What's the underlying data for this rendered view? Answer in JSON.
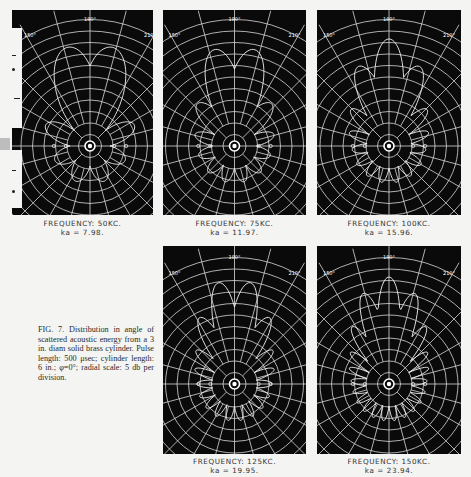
{
  "figure": {
    "label": "FIG. 7.",
    "caption": "FIG. 7. Distribution in angle of scattered acoustic energy from a 3 in. diam solid brass cylinder. Pulse length: 500 μsec; cylinder length: 6 in.; φ=0°; radial scale: 5 db per division."
  },
  "panels": [
    {
      "id": "p50",
      "frequency": "FREQUENCY: 50KC.",
      "ka": "ka = 7.98.",
      "angle_labels": {
        "top": "180°",
        "left": "150°",
        "right": "210°"
      }
    },
    {
      "id": "p75",
      "frequency": "FREQUENCY: 75KC.",
      "ka": "ka = 11.97.",
      "angle_labels": {
        "top": "180°",
        "left": "150°",
        "right": "210°"
      }
    },
    {
      "id": "p100",
      "frequency": "FREQUENCY: 100KC.",
      "ka": "ka = 15.96.",
      "angle_labels": {
        "top": "180°",
        "left": "150°",
        "right": "210°"
      }
    },
    {
      "id": "p125",
      "frequency": "FREQUENCY: 125KC.",
      "ka": "ka = 19.95.",
      "angle_labels": {
        "top": "180°",
        "left": "150°",
        "right": "210°"
      }
    },
    {
      "id": "p150",
      "frequency": "FREQUENCY: 150KC.",
      "ka": "ka = 23.94.",
      "angle_labels": {
        "top": "180°",
        "left": "150°",
        "right": "210°"
      }
    }
  ],
  "chart_data": [
    {
      "type": "polar",
      "title": "FREQUENCY: 50KC.",
      "subtitle": "ka = 7.98",
      "radial_scale": "5 db per division",
      "grid": true,
      "angular_step_deg": 15,
      "lobes_deg": [
        0,
        20,
        40,
        70,
        110,
        140,
        160,
        180,
        200,
        220,
        250,
        290,
        320,
        340
      ]
    },
    {
      "type": "polar",
      "title": "FREQUENCY: 75KC.",
      "subtitle": "ka = 11.97",
      "radial_scale": "5 db per division",
      "grid": true,
      "angular_step_deg": 15
    },
    {
      "type": "polar",
      "title": "FREQUENCY: 100KC.",
      "subtitle": "ka = 15.96",
      "radial_scale": "5 db per division",
      "grid": true,
      "angular_step_deg": 15
    },
    {
      "type": "polar",
      "title": "FREQUENCY: 125KC.",
      "subtitle": "ka = 19.95",
      "radial_scale": "5 db per division",
      "grid": true,
      "angular_step_deg": 15
    },
    {
      "type": "polar",
      "title": "FREQUENCY: 150KC.",
      "subtitle": "ka = 23.94",
      "radial_scale": "5 db per division",
      "grid": true,
      "angular_step_deg": 15
    }
  ]
}
